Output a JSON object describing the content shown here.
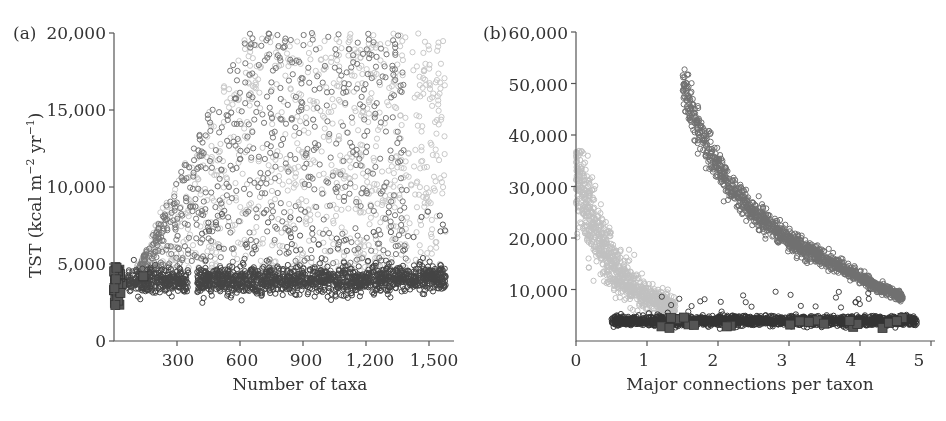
{
  "chart_data": [
    {
      "panel": "a",
      "type": "scatter",
      "title": "",
      "xlabel": "Number of taxa",
      "ylabel": "TST (kcal m^-2 yr^-1)",
      "xlim": [
        0,
        1600
      ],
      "ylim": [
        0,
        20000
      ],
      "xticks": [
        300,
        600,
        900,
        1200,
        1500
      ],
      "xtick_labels": [
        "300",
        "600",
        "900",
        "1,200",
        "1,500"
      ],
      "yticks": [
        0,
        5000,
        10000,
        15000,
        20000
      ],
      "ytick_labels": [
        "0",
        "5,000",
        "10,000",
        "15,000",
        "20,000"
      ],
      "grid": false,
      "legend": null,
      "series": [
        {
          "name": "light-gray circles (spread, rising)",
          "marker": "open-circle",
          "color": "#c8c8c8",
          "description": "fan rising from ~5,000 at 100 taxa to 5,000-20,000 over 600-1,580 taxa",
          "x_range": [
            100,
            1580
          ],
          "y_range": [
            4000,
            20000
          ]
        },
        {
          "name": "mid-gray circles (spread, rising)",
          "marker": "open-circle",
          "color": "#777777",
          "description": "similar fan, densest 400-1,100 taxa, 5,000-20,000",
          "x_range": [
            120,
            1400
          ],
          "y_range": [
            4000,
            20000
          ]
        },
        {
          "name": "dark circles (flat band)",
          "marker": "open-circle",
          "color": "#444444",
          "description": "flat band ~3,000-5,000 across 100-1,580 taxa, gap near 360-400 taxa, occasional outliers to ~8,500",
          "x_range": [
            60,
            1580
          ],
          "y_range": [
            2800,
            5000
          ]
        },
        {
          "name": "dark squares",
          "marker": "filled-square",
          "color": "#555555",
          "description": "cluster at very low taxa counts",
          "x_range": [
            0,
            160
          ],
          "y_range": [
            2000,
            4800
          ]
        }
      ]
    },
    {
      "panel": "b",
      "type": "scatter",
      "title": "",
      "xlabel": "Major connections per taxon",
      "ylabel": "",
      "xlim": [
        0,
        5
      ],
      "ylim": [
        0,
        60000
      ],
      "xticks": [
        0,
        1,
        2,
        3,
        4,
        5
      ],
      "xtick_labels": [
        "0",
        "1",
        "2",
        "3",
        "4",
        "5"
      ],
      "yticks": [
        10000,
        20000,
        30000,
        40000,
        50000,
        60000
      ],
      "ytick_labels": [
        "10,000",
        "20,000",
        "30,000",
        "40,000",
        "50,000",
        "60,000"
      ],
      "grid": false,
      "legend": null,
      "series": [
        {
          "name": "light-gray circles (steep decay)",
          "marker": "open-circle",
          "color": "#c0c0c0",
          "description": "decays from ~36,000 at x=0 to ~5,000 at x~1.3",
          "points_approx": [
            [
              0.0,
              33000
            ],
            [
              0.2,
              30000
            ],
            [
              0.4,
              22000
            ],
            [
              0.6,
              15000
            ],
            [
              0.8,
              10000
            ],
            [
              1.0,
              7000
            ],
            [
              1.3,
              5000
            ]
          ]
        },
        {
          "name": "mid-gray circles (hyperbolic curve)",
          "marker": "open-circle",
          "color": "#707070",
          "description": "hyperbolic curve from ~50,000 at x=1.5 down to ~4,000 at x=4.5",
          "points_approx": [
            [
              1.5,
              50000
            ],
            [
              2.0,
              36000
            ],
            [
              2.5,
              26000
            ],
            [
              3.0,
              18000
            ],
            [
              3.5,
              12500
            ],
            [
              4.0,
              7500
            ],
            [
              4.5,
              4000
            ]
          ]
        },
        {
          "name": "dark circles (flat band)",
          "marker": "open-circle",
          "color": "#333333",
          "description": "flat band ~3,000-5,000 from x=0.5 to x=4.8, a few outliers to ~10,000",
          "x_range": [
            0.5,
            4.8
          ],
          "y_range": [
            2800,
            5200
          ]
        },
        {
          "name": "dark squares",
          "marker": "filled-square",
          "color": "#555555",
          "description": "scattered along band at ~3,000-5,000",
          "x_range": [
            1.0,
            4.6
          ],
          "y_range": [
            2000,
            5000
          ]
        }
      ]
    }
  ],
  "panels": {
    "a": {
      "label": "(a)"
    },
    "b": {
      "label": "(b)"
    }
  }
}
